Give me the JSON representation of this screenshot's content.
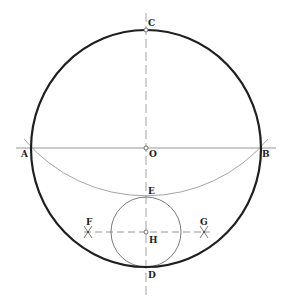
{
  "diagram": {
    "colors": {
      "main_circle": "#1f1f1f",
      "construction": "#9a9a9a",
      "axis": "#8a8a8a",
      "small_circle": "#6a6a6a",
      "label": "#222222"
    },
    "main_circle": {
      "cx": 146,
      "cy": 148.5,
      "rx": 115,
      "ry": 118.5
    },
    "small_circle": {
      "cx": 146,
      "cy": 232,
      "r": 35
    },
    "construction_arc": {
      "cx": 146,
      "cy": 37.6,
      "r": 159.4
    },
    "horizontal_line": {
      "x1": 16,
      "x2": 276,
      "y": 148
    },
    "vertical_axis": {
      "x": 146,
      "y1": 13,
      "y2": 298
    },
    "fg_line": {
      "x1": 84,
      "x2": 210,
      "y": 232
    },
    "points": [
      {
        "id": "A",
        "label": "A",
        "x": 31,
        "y": 148
      },
      {
        "id": "B",
        "label": "B",
        "x": 260,
        "y": 148
      },
      {
        "id": "C",
        "label": "C",
        "x": 146,
        "y": 30
      },
      {
        "id": "D",
        "label": "D",
        "x": 146,
        "y": 267
      },
      {
        "id": "E",
        "label": "E",
        "x": 146,
        "y": 197
      },
      {
        "id": "F",
        "label": "F",
        "x": 88,
        "y": 232
      },
      {
        "id": "G",
        "label": "G",
        "x": 204,
        "y": 232
      },
      {
        "id": "H",
        "label": "H",
        "x": 146,
        "y": 232
      },
      {
        "id": "O",
        "label": "O",
        "x": 146,
        "y": 148
      }
    ],
    "labels": {
      "A": "A",
      "B": "B",
      "C": "C",
      "D": "D",
      "E": "E",
      "F": "F",
      "G": "G",
      "H": "H",
      "O": "O"
    }
  }
}
